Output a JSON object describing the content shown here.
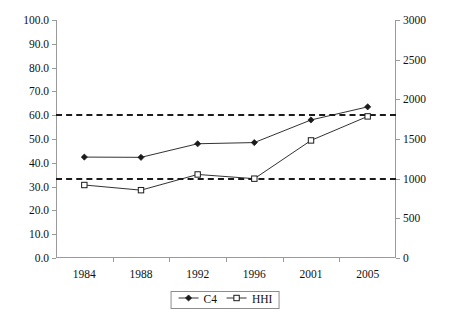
{
  "chart_data": {
    "type": "line",
    "title": "",
    "subtitle": "",
    "xlabel": "",
    "ylabel": "",
    "categories": [
      "1984",
      "1988",
      "1992",
      "1996",
      "2001",
      "2005"
    ],
    "grid": false,
    "legend_position": "bottom",
    "axes": {
      "left": {
        "label": "",
        "ylim": [
          0,
          100
        ],
        "tick_step": 10,
        "ticks": [
          "0.0",
          "10.0",
          "20.0",
          "30.0",
          "40.0",
          "50.0",
          "60.0",
          "70.0",
          "80.0",
          "90.0",
          "100.0"
        ],
        "tick_values": [
          0,
          10,
          20,
          30,
          40,
          50,
          60,
          70,
          80,
          90,
          100
        ]
      },
      "right": {
        "label": "",
        "ylim": [
          0,
          3000
        ],
        "tick_step": 500,
        "ticks": [
          "0",
          "500",
          "1000",
          "1500",
          "2000",
          "2500",
          "3000"
        ],
        "tick_values": [
          0,
          500,
          1000,
          1500,
          2000,
          2500,
          3000
        ]
      }
    },
    "series": [
      {
        "name": "C4",
        "axis": "left",
        "marker": "filled-diamond",
        "color": "#1b1b1b",
        "values": [
          42.4,
          42.3,
          48.0,
          48.5,
          58.0,
          63.5
        ]
      },
      {
        "name": "HHI",
        "axis": "right",
        "marker": "open-square",
        "color": "#1b1b1b",
        "values": [
          920,
          855,
          1053,
          1000,
          1482,
          1785
        ]
      }
    ],
    "reference_lines": [
      {
        "name": "c4-threshold",
        "axis": "left",
        "value": 60.0,
        "style": "dashed",
        "color": "#1b1b1b"
      },
      {
        "name": "hhi-threshold",
        "axis": "right",
        "value": 1000,
        "style": "dashed",
        "color": "#1b1b1b"
      }
    ]
  },
  "legend": {
    "items": [
      {
        "label": "C4",
        "marker": "filled-diamond"
      },
      {
        "label": "HHI",
        "marker": "open-square"
      }
    ]
  }
}
